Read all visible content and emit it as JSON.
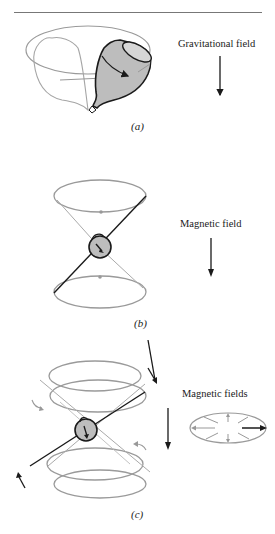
{
  "figure": {
    "panels": [
      {
        "id": "a",
        "caption": "(a)",
        "field_label": "Gravitational field",
        "object": "spinning-top"
      },
      {
        "id": "b",
        "caption": "(b)",
        "field_label": "Magnetic field",
        "object": "spinning-magnetic-dipole-precessing-cone"
      },
      {
        "id": "c",
        "caption": "(c)",
        "field_label": "Magnetic fields",
        "object": "precessing-dipole-with-rotating-field"
      }
    ],
    "colors": {
      "line_gray": "#9a9a9a",
      "dark": "#1a1a1a",
      "fill_gray": "#bdbdbd"
    }
  }
}
